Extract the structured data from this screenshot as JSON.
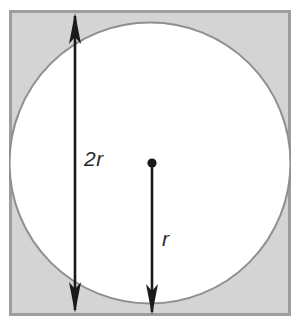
{
  "labels": {
    "diameter": "2r",
    "radius": "r"
  },
  "colors": {
    "square_fill": "#d4d4d4",
    "square_stroke": "#9e9e9e",
    "circle_fill": "#ffffff",
    "circle_stroke": "#8f8f8f",
    "arrow": "#1a1a1a",
    "label_text": "#2b2b2b",
    "page_background": "#ffffff"
  },
  "geometry": {
    "square": {
      "x": 9,
      "y": 10,
      "width": 282,
      "height": 306,
      "stroke_width": 3
    },
    "circle": {
      "cx": 150,
      "cy": 163,
      "r": 141,
      "stroke_width": 2
    },
    "center_dot": {
      "cx": 152,
      "cy": 163,
      "r": 4.5
    },
    "diameter_arrow": {
      "x": 75,
      "y_top": 14,
      "y_bottom": 312,
      "stroke_width": 2.6,
      "double_headed": true,
      "head_width": 13,
      "head_length": 30
    },
    "radius_arrow": {
      "x": 152,
      "y_top": 163,
      "y_bottom": 314,
      "stroke_width": 2.6,
      "double_headed": false,
      "head_width": 13,
      "head_length": 30
    }
  }
}
